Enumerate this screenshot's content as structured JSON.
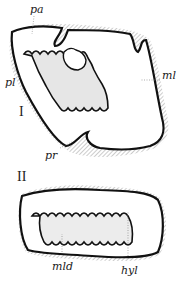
{
  "figures": [
    {
      "numeral": "I",
      "labels": {
        "pa": "pa",
        "pl": "pl",
        "ml": "ml",
        "pr": "pr"
      }
    },
    {
      "numeral": "II",
      "labels": {
        "mld": "mld",
        "hyl": "hyl"
      }
    }
  ],
  "colors": {
    "ink": "#111111",
    "shade": "#bdbdbd",
    "paper": "#ffffff"
  }
}
